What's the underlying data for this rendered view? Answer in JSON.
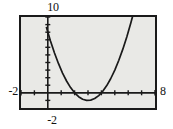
{
  "figure": {
    "name": "graphing-calculator-window",
    "background_color": "#ffffff",
    "plot_background_color": "#e9e9e6",
    "frame_color": "#1a1a1a",
    "curve_color": "#1a1a1a"
  },
  "labels": {
    "y_max": "10",
    "y_min": "-2",
    "x_min": "-2",
    "x_max": "8"
  },
  "chart_data": {
    "type": "line",
    "title": "",
    "xlabel": "",
    "ylabel": "",
    "xlim": [
      -2,
      8
    ],
    "ylim": [
      -2,
      10
    ],
    "grid": false,
    "legend": null,
    "axes": {
      "x_axis_at_y": 0,
      "y_axis_at_x": 0,
      "x_tick_spacing": 1,
      "y_tick_spacing": 1,
      "x_ticks": [
        -2,
        -1,
        0,
        1,
        2,
        3,
        4,
        5,
        6,
        7,
        8
      ],
      "y_ticks": [
        -2,
        -1,
        0,
        1,
        2,
        3,
        4,
        5,
        6,
        7,
        8,
        9,
        10
      ],
      "tick_style": "short-marks-on-axis"
    },
    "series": [
      {
        "name": "parabola",
        "equation": "y = (x - 3)^2 - 1",
        "vertex": [
          3,
          -1
        ],
        "x": [
          -0.1,
          0.2,
          0.5,
          0.8,
          1.1,
          1.4,
          1.7,
          2.0,
          2.3,
          2.6,
          2.9,
          3.2,
          3.5,
          3.8,
          4.1,
          4.4,
          4.7,
          5.0,
          5.3,
          5.6,
          5.9,
          6.2,
          6.4
        ],
        "values": [
          8.61,
          6.84,
          5.25,
          3.84,
          2.61,
          1.56,
          0.69,
          0.0,
          -0.51,
          -0.84,
          -0.99,
          -0.96,
          -0.75,
          -0.36,
          0.21,
          0.96,
          1.89,
          3.0,
          4.29,
          5.76,
          7.41,
          9.24,
          10.56
        ]
      }
    ]
  }
}
